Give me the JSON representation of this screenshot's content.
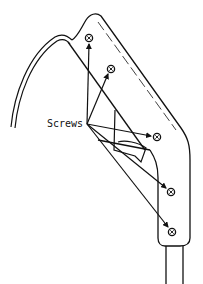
{
  "diagram": {
    "type": "technical-illustration",
    "callout": {
      "label": "Screws",
      "count": 5
    },
    "colors": {
      "line": "#111111",
      "background": "#ffffff"
    }
  }
}
